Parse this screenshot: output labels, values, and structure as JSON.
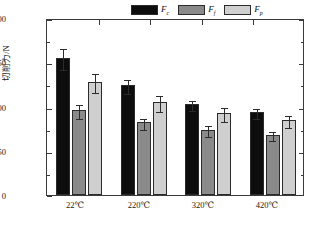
{
  "chart_data": {
    "type": "bar",
    "title": "",
    "xlabel": "",
    "ylabel": "切削力/N",
    "categories": [
      "22℃",
      "220℃",
      "320℃",
      "420℃"
    ],
    "ylim": [
      0,
      200
    ],
    "y_ticks": [
      0,
      50,
      100,
      150,
      200
    ],
    "y_tick_labels": [
      "0",
      "50",
      "100",
      "150",
      "200"
    ],
    "y_minor_ticks": [
      25,
      75,
      125,
      175
    ],
    "grid": false,
    "legend_position": "top-right",
    "series": [
      {
        "name": "Fc",
        "label_main": "F",
        "label_sub": "c",
        "color": "#0d0d0d",
        "values": [
          155,
          124,
          103,
          94
        ],
        "errors": [
          12,
          8,
          6,
          6
        ]
      },
      {
        "name": "Ff",
        "label_main": "F",
        "label_sub": "f",
        "color": "#8a8a8a",
        "values": [
          96,
          82,
          74,
          68
        ],
        "errors": [
          8,
          6,
          6,
          5
        ]
      },
      {
        "name": "Fp",
        "label_main": "F",
        "label_sub": "p",
        "color": "#cfcfcf",
        "values": [
          128,
          105,
          93,
          85
        ],
        "errors": [
          11,
          9,
          8,
          7
        ]
      }
    ]
  },
  "axes": {
    "y_label_text": "切削力/N",
    "tick_0": "0",
    "tick_50": "50",
    "tick_100": "100",
    "tick_150": "150",
    "tick_200": "200",
    "cat_0": "22℃",
    "cat_1": "220℃",
    "cat_2": "320℃",
    "cat_3": "420℃"
  },
  "legend": {
    "entries": [
      {
        "main": "F",
        "sub": "c"
      },
      {
        "main": "F",
        "sub": "f"
      },
      {
        "main": "F",
        "sub": "p"
      }
    ]
  },
  "colors": {
    "series_0": "#0d0d0d",
    "series_1": "#8a8a8a",
    "series_2": "#cfcfcf",
    "axis": "#3a3a3a",
    "text": "#1a1a1a",
    "background": "#ffffff"
  }
}
